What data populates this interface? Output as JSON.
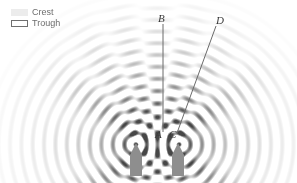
{
  "figure": {
    "background_color": "#ffffff",
    "width": 297,
    "height": 183
  },
  "legend": {
    "position": "top-left",
    "items": [
      {
        "key": "crest",
        "label": "Crest",
        "swatch_icon": "filled-rect-swatch",
        "fill": "#ececec",
        "stroke": "none"
      },
      {
        "key": "trough",
        "label": "Trough",
        "swatch_icon": "outlined-rect-swatch",
        "fill": "#ffffff",
        "stroke": "#6f6f6f"
      }
    ]
  },
  "labels": {
    "B": "B",
    "D": "D",
    "A": "A",
    "C": "C"
  },
  "chart_data": {
    "type": "scatter",
    "xlabel": "",
    "ylabel": "",
    "xlim": [
      0,
      297
    ],
    "ylim": [
      0,
      183
    ],
    "grid": false,
    "legend_position": "top-left",
    "series": [
      {
        "name": "Crest",
        "color": "#ececec",
        "description": "Light filled circular wavefront rings radiating from each source"
      },
      {
        "name": "Trough",
        "color": "#ffffff",
        "description": "White circular wavefront rings between crests"
      }
    ],
    "sources": [
      {
        "id": "S1",
        "x": 136,
        "y": 144,
        "marker": "pentagon-source"
      },
      {
        "id": "S2",
        "x": 178,
        "y": 144,
        "marker": "pentagon-source"
      }
    ],
    "wavelength_px": 11.5,
    "ring_count": 14,
    "annotations": [
      {
        "text": "A",
        "x": 163,
        "y": 133,
        "kind": "point-label"
      },
      {
        "text": "B",
        "x": 163,
        "y": 23,
        "kind": "point-label"
      },
      {
        "text": "C",
        "x": 177,
        "y": 133,
        "kind": "point-label"
      },
      {
        "text": "D",
        "x": 217,
        "y": 26,
        "kind": "point-label"
      }
    ],
    "lines": [
      {
        "name": "AB",
        "x1": 163,
        "y1": 132,
        "x2": 163,
        "y2": 24,
        "color": "#6a6a6a",
        "width": 1
      },
      {
        "name": "CD",
        "x1": 177,
        "y1": 133,
        "x2": 216,
        "y2": 26,
        "color": "#6a6a6a",
        "width": 1
      }
    ]
  }
}
